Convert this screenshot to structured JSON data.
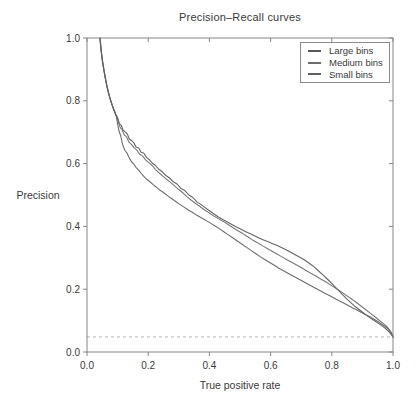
{
  "chart_data": {
    "type": "line",
    "title": "Precision–Recall curves",
    "xlabel": "True positive rate",
    "ylabel": "Precision",
    "xlim": [
      0,
      1
    ],
    "ylim": [
      0,
      1
    ],
    "xticks": [
      0,
      0.2,
      0.4,
      0.6,
      0.8,
      1.0
    ],
    "yticks": [
      0,
      0.2,
      0.4,
      0.6,
      0.8,
      1.0
    ],
    "xtick_labels": [
      "0.0",
      "0.2",
      "0.4",
      "0.6",
      "0.8",
      "1.0"
    ],
    "ytick_labels": [
      "0.0",
      "0.2",
      "0.4",
      "0.6",
      "0.8",
      "1.0"
    ],
    "grid": false,
    "legend_position": "top-right",
    "axis_color": "#868686",
    "text_color": "#3a3a3a",
    "baseline": {
      "y": 0.048,
      "style": "dashed",
      "color": "#b5b5b5"
    },
    "series": [
      {
        "name": "Large bins",
        "color": "#585858",
        "points": [
          [
            0.042,
            1.0
          ],
          [
            0.046,
            0.96
          ],
          [
            0.05,
            0.928
          ],
          [
            0.055,
            0.898
          ],
          [
            0.06,
            0.87
          ],
          [
            0.065,
            0.845
          ],
          [
            0.071,
            0.822
          ],
          [
            0.077,
            0.801
          ],
          [
            0.083,
            0.784
          ],
          [
            0.09,
            0.767
          ],
          [
            0.096,
            0.752
          ],
          [
            0.101,
            0.744
          ],
          [
            0.106,
            0.727
          ],
          [
            0.112,
            0.722
          ],
          [
            0.118,
            0.706
          ],
          [
            0.125,
            0.701
          ],
          [
            0.132,
            0.694
          ],
          [
            0.138,
            0.679
          ],
          [
            0.146,
            0.673
          ],
          [
            0.153,
            0.667
          ],
          [
            0.16,
            0.653
          ],
          [
            0.169,
            0.65
          ],
          [
            0.177,
            0.636
          ],
          [
            0.186,
            0.633
          ],
          [
            0.195,
            0.619
          ],
          [
            0.204,
            0.612
          ],
          [
            0.214,
            0.601
          ],
          [
            0.224,
            0.594
          ],
          [
            0.235,
            0.582
          ],
          [
            0.246,
            0.574
          ],
          [
            0.258,
            0.562
          ],
          [
            0.27,
            0.554
          ],
          [
            0.282,
            0.542
          ],
          [
            0.294,
            0.535
          ],
          [
            0.307,
            0.521
          ],
          [
            0.32,
            0.514
          ],
          [
            0.333,
            0.5
          ],
          [
            0.346,
            0.492
          ],
          [
            0.359,
            0.478
          ],
          [
            0.372,
            0.47
          ],
          [
            0.386,
            0.46
          ],
          [
            0.4,
            0.45
          ],
          [
            0.414,
            0.44
          ],
          [
            0.428,
            0.431
          ],
          [
            0.442,
            0.423
          ],
          [
            0.457,
            0.415
          ],
          [
            0.472,
            0.407
          ],
          [
            0.487,
            0.399
          ],
          [
            0.502,
            0.392
          ],
          [
            0.517,
            0.384
          ],
          [
            0.532,
            0.377
          ],
          [
            0.547,
            0.37
          ],
          [
            0.562,
            0.363
          ],
          [
            0.577,
            0.357
          ],
          [
            0.592,
            0.351
          ],
          [
            0.607,
            0.345
          ],
          [
            0.622,
            0.339
          ],
          [
            0.637,
            0.332
          ],
          [
            0.652,
            0.325
          ],
          [
            0.667,
            0.317
          ],
          [
            0.682,
            0.309
          ],
          [
            0.697,
            0.301
          ],
          [
            0.712,
            0.292
          ],
          [
            0.727,
            0.282
          ],
          [
            0.742,
            0.271
          ],
          [
            0.757,
            0.258
          ],
          [
            0.772,
            0.245
          ],
          [
            0.787,
            0.231
          ],
          [
            0.802,
            0.216
          ],
          [
            0.817,
            0.201
          ],
          [
            0.832,
            0.186
          ],
          [
            0.847,
            0.171
          ],
          [
            0.862,
            0.157
          ],
          [
            0.877,
            0.144
          ],
          [
            0.892,
            0.133
          ],
          [
            0.907,
            0.122
          ],
          [
            0.922,
            0.111
          ],
          [
            0.937,
            0.101
          ],
          [
            0.951,
            0.092
          ],
          [
            0.963,
            0.084
          ],
          [
            0.974,
            0.076
          ],
          [
            0.983,
            0.068
          ],
          [
            0.99,
            0.061
          ],
          [
            0.995,
            0.054
          ],
          [
            1.0,
            0.047
          ]
        ]
      },
      {
        "name": "Medium bins",
        "color": "#6e6e6e",
        "points": [
          [
            0.043,
            1.0
          ],
          [
            0.047,
            0.957
          ],
          [
            0.051,
            0.924
          ],
          [
            0.056,
            0.894
          ],
          [
            0.061,
            0.866
          ],
          [
            0.067,
            0.84
          ],
          [
            0.073,
            0.816
          ],
          [
            0.079,
            0.796
          ],
          [
            0.085,
            0.779
          ],
          [
            0.092,
            0.762
          ],
          [
            0.098,
            0.748
          ],
          [
            0.103,
            0.73
          ],
          [
            0.109,
            0.714
          ],
          [
            0.115,
            0.707
          ],
          [
            0.122,
            0.691
          ],
          [
            0.129,
            0.686
          ],
          [
            0.137,
            0.668
          ],
          [
            0.145,
            0.661
          ],
          [
            0.154,
            0.65
          ],
          [
            0.163,
            0.643
          ],
          [
            0.172,
            0.63
          ],
          [
            0.182,
            0.624
          ],
          [
            0.192,
            0.611
          ],
          [
            0.202,
            0.603
          ],
          [
            0.213,
            0.594
          ],
          [
            0.224,
            0.581
          ],
          [
            0.236,
            0.57
          ],
          [
            0.248,
            0.56
          ],
          [
            0.26,
            0.55
          ],
          [
            0.273,
            0.54
          ],
          [
            0.286,
            0.529
          ],
          [
            0.299,
            0.518
          ],
          [
            0.312,
            0.508
          ],
          [
            0.326,
            0.495
          ],
          [
            0.34,
            0.484
          ],
          [
            0.354,
            0.474
          ],
          [
            0.368,
            0.464
          ],
          [
            0.383,
            0.453
          ],
          [
            0.398,
            0.444
          ],
          [
            0.413,
            0.434
          ],
          [
            0.429,
            0.425
          ],
          [
            0.445,
            0.416
          ],
          [
            0.461,
            0.406
          ],
          [
            0.477,
            0.396
          ],
          [
            0.493,
            0.386
          ],
          [
            0.509,
            0.377
          ],
          [
            0.525,
            0.367
          ],
          [
            0.541,
            0.357
          ],
          [
            0.557,
            0.348
          ],
          [
            0.573,
            0.339
          ],
          [
            0.589,
            0.33
          ],
          [
            0.605,
            0.321
          ],
          [
            0.621,
            0.312
          ],
          [
            0.637,
            0.303
          ],
          [
            0.653,
            0.294
          ],
          [
            0.669,
            0.286
          ],
          [
            0.685,
            0.277
          ],
          [
            0.701,
            0.268
          ],
          [
            0.717,
            0.259
          ],
          [
            0.733,
            0.25
          ],
          [
            0.749,
            0.241
          ],
          [
            0.765,
            0.232
          ],
          [
            0.781,
            0.223
          ],
          [
            0.797,
            0.213
          ],
          [
            0.813,
            0.203
          ],
          [
            0.829,
            0.193
          ],
          [
            0.845,
            0.182
          ],
          [
            0.861,
            0.171
          ],
          [
            0.877,
            0.16
          ],
          [
            0.893,
            0.148
          ],
          [
            0.909,
            0.136
          ],
          [
            0.925,
            0.124
          ],
          [
            0.941,
            0.112
          ],
          [
            0.955,
            0.101
          ],
          [
            0.967,
            0.092
          ],
          [
            0.978,
            0.083
          ],
          [
            0.986,
            0.074
          ],
          [
            0.993,
            0.064
          ],
          [
            0.998,
            0.055
          ],
          [
            1.0,
            0.047
          ]
        ]
      },
      {
        "name": "Small bins",
        "color": "#606060",
        "points": [
          [
            0.042,
            1.0
          ],
          [
            0.046,
            0.959
          ],
          [
            0.051,
            0.926
          ],
          [
            0.056,
            0.896
          ],
          [
            0.061,
            0.868
          ],
          [
            0.066,
            0.842
          ],
          [
            0.072,
            0.819
          ],
          [
            0.078,
            0.799
          ],
          [
            0.084,
            0.781
          ],
          [
            0.09,
            0.765
          ],
          [
            0.096,
            0.749
          ],
          [
            0.1,
            0.726
          ],
          [
            0.105,
            0.703
          ],
          [
            0.11,
            0.688
          ],
          [
            0.115,
            0.666
          ],
          [
            0.12,
            0.651
          ],
          [
            0.125,
            0.64
          ],
          [
            0.131,
            0.633
          ],
          [
            0.138,
            0.618
          ],
          [
            0.146,
            0.605
          ],
          [
            0.153,
            0.598
          ],
          [
            0.16,
            0.588
          ],
          [
            0.168,
            0.58
          ],
          [
            0.176,
            0.57
          ],
          [
            0.185,
            0.56
          ],
          [
            0.195,
            0.55
          ],
          [
            0.205,
            0.543
          ],
          [
            0.216,
            0.533
          ],
          [
            0.227,
            0.525
          ],
          [
            0.239,
            0.515
          ],
          [
            0.251,
            0.507
          ],
          [
            0.263,
            0.498
          ],
          [
            0.276,
            0.489
          ],
          [
            0.289,
            0.48
          ],
          [
            0.302,
            0.471
          ],
          [
            0.316,
            0.462
          ],
          [
            0.33,
            0.453
          ],
          [
            0.344,
            0.445
          ],
          [
            0.358,
            0.436
          ],
          [
            0.372,
            0.428
          ],
          [
            0.387,
            0.42
          ],
          [
            0.402,
            0.411
          ],
          [
            0.417,
            0.402
          ],
          [
            0.432,
            0.393
          ],
          [
            0.447,
            0.383
          ],
          [
            0.462,
            0.373
          ],
          [
            0.477,
            0.363
          ],
          [
            0.492,
            0.353
          ],
          [
            0.507,
            0.343
          ],
          [
            0.522,
            0.333
          ],
          [
            0.537,
            0.323
          ],
          [
            0.552,
            0.313
          ],
          [
            0.567,
            0.303
          ],
          [
            0.582,
            0.294
          ],
          [
            0.597,
            0.285
          ],
          [
            0.612,
            0.276
          ],
          [
            0.627,
            0.267
          ],
          [
            0.642,
            0.259
          ],
          [
            0.657,
            0.251
          ],
          [
            0.672,
            0.243
          ],
          [
            0.687,
            0.235
          ],
          [
            0.702,
            0.227
          ],
          [
            0.717,
            0.219
          ],
          [
            0.732,
            0.211
          ],
          [
            0.747,
            0.203
          ],
          [
            0.762,
            0.195
          ],
          [
            0.777,
            0.187
          ],
          [
            0.792,
            0.18
          ],
          [
            0.807,
            0.172
          ],
          [
            0.822,
            0.164
          ],
          [
            0.837,
            0.157
          ],
          [
            0.852,
            0.149
          ],
          [
            0.867,
            0.141
          ],
          [
            0.882,
            0.134
          ],
          [
            0.897,
            0.126
          ],
          [
            0.912,
            0.118
          ],
          [
            0.927,
            0.111
          ],
          [
            0.941,
            0.103
          ],
          [
            0.954,
            0.095
          ],
          [
            0.966,
            0.087
          ],
          [
            0.977,
            0.079
          ],
          [
            0.986,
            0.071
          ],
          [
            0.993,
            0.062
          ],
          [
            0.998,
            0.054
          ],
          [
            1.0,
            0.047
          ]
        ]
      }
    ]
  }
}
